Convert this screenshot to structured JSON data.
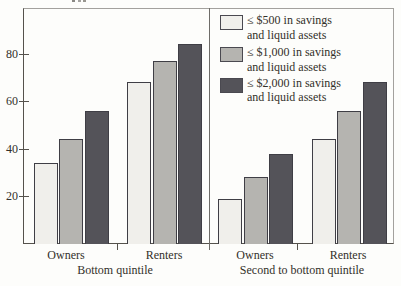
{
  "chart_data": {
    "type": "bar",
    "ylim": [
      0,
      99
    ],
    "yticks": [
      20,
      40,
      60,
      80
    ],
    "grid": false,
    "legend_position": "top-right",
    "series": [
      {
        "name": "≤ $500 in savings and liquid assets",
        "key": "500",
        "color": "#f0efeb"
      },
      {
        "name": "≤ $1,000 in savings and liquid assets",
        "key": "1000",
        "color": "#b5b4b0"
      },
      {
        "name": "≤ $2,000 in savings and liquid assets",
        "key": "2000",
        "color": "#545359"
      }
    ],
    "panels": [
      {
        "label": "Bottom quintile",
        "groups": [
          {
            "label": "Owners",
            "values": [
              34,
              44,
              56
            ]
          },
          {
            "label": "Renters",
            "values": [
              68,
              77,
              84
            ]
          }
        ]
      },
      {
        "label": "Second to bottom quintile",
        "groups": [
          {
            "label": "Owners",
            "values": [
              19,
              28,
              38
            ]
          },
          {
            "label": "Renters",
            "values": [
              44,
              56,
              68
            ]
          }
        ]
      }
    ],
    "legend": {
      "entries": [
        {
          "line1": "≤ $500 in savings",
          "line2": "and liquid assets"
        },
        {
          "line1": "≤ $1,000 in savings",
          "line2": "and liquid assets"
        },
        {
          "line1": "≤ $2,000 in savings",
          "line2": "and liquid assets"
        }
      ]
    }
  }
}
